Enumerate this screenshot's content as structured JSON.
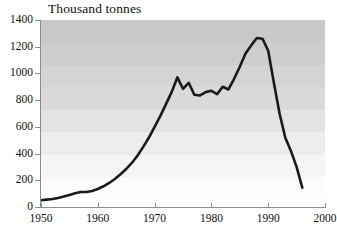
{
  "chart_data": {
    "type": "line",
    "title": "Thousand tonnes",
    "xlabel": "",
    "ylabel": "Thousand tonnes",
    "xlim": [
      1950,
      2000
    ],
    "ylim": [
      0,
      1400
    ],
    "xticks": [
      1950,
      1960,
      1970,
      1980,
      1990,
      2000
    ],
    "yticks": [
      0,
      200,
      400,
      600,
      800,
      1000,
      1200,
      1400
    ],
    "grid": false,
    "legend": "none",
    "background": "banded-grey-gradient",
    "line_color": "#1a1a1a",
    "series": [
      {
        "name": "Production",
        "x": [
          1950,
          1951,
          1952,
          1953,
          1954,
          1955,
          1956,
          1957,
          1958,
          1959,
          1960,
          1961,
          1962,
          1963,
          1964,
          1965,
          1966,
          1967,
          1968,
          1969,
          1970,
          1971,
          1972,
          1973,
          1974,
          1975,
          1976,
          1977,
          1978,
          1979,
          1980,
          1981,
          1982,
          1983,
          1984,
          1985,
          1986,
          1987,
          1988,
          1989,
          1990,
          1991,
          1992,
          1993,
          1994,
          1995,
          1996
        ],
        "values": [
          50,
          55,
          60,
          68,
          78,
          90,
          103,
          112,
          112,
          120,
          135,
          155,
          180,
          210,
          245,
          285,
          330,
          385,
          450,
          520,
          600,
          680,
          770,
          860,
          970,
          885,
          930,
          840,
          835,
          860,
          870,
          845,
          900,
          880,
          960,
          1050,
          1150,
          1210,
          1265,
          1260,
          1170,
          930,
          700,
          520,
          420,
          300,
          145
        ]
      }
    ]
  },
  "axis": {
    "y_tick_labels": [
      "1400",
      "1200",
      "1000",
      "800",
      "600",
      "400",
      "200",
      "0"
    ],
    "x_tick_labels": [
      "1950",
      "1960",
      "1970",
      "1980",
      "1990",
      "2000"
    ]
  }
}
